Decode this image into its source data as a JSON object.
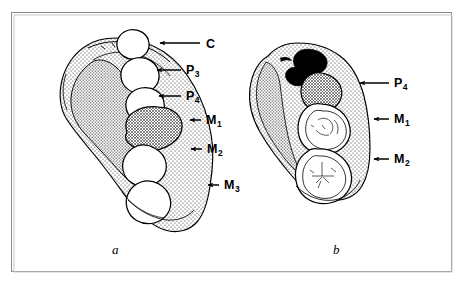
{
  "figure": {
    "type": "scientific-illustration",
    "background_color": "#ffffff",
    "ink_color": "#000000",
    "frame_color": "#8a8a8a",
    "panels": [
      {
        "id": "a",
        "caption": "a",
        "view": "lateral-buccal",
        "labels": [
          {
            "name": "canine",
            "text": "C",
            "sub": "",
            "x": 206,
            "y": 38,
            "arrow_from_x": 200,
            "arrow_to_x": 160,
            "arrow_y": 43
          },
          {
            "name": "premolar-3",
            "text": "P",
            "sub": "3",
            "x": 186,
            "y": 64,
            "arrow_from_x": 181,
            "arrow_to_x": 157,
            "arrow_y": 70
          },
          {
            "name": "premolar-4",
            "text": "P",
            "sub": "4",
            "x": 186,
            "y": 90,
            "arrow_from_x": 181,
            "arrow_to_x": 159,
            "arrow_y": 96
          },
          {
            "name": "molar-1",
            "text": "M",
            "sub": "1",
            "x": 206,
            "y": 114,
            "arrow_from_x": 201,
            "arrow_to_x": 190,
            "arrow_y": 120
          },
          {
            "name": "molar-2",
            "text": "M",
            "sub": "2",
            "x": 207,
            "y": 143,
            "arrow_from_x": 202,
            "arrow_to_x": 191,
            "arrow_y": 149
          },
          {
            "name": "molar-3",
            "text": "M",
            "sub": "3",
            "x": 224,
            "y": 179,
            "arrow_from_x": 219,
            "arrow_to_x": 208,
            "arrow_y": 185
          }
        ]
      },
      {
        "id": "b",
        "caption": "b",
        "view": "occlusal",
        "labels": [
          {
            "name": "premolar-4",
            "text": "P",
            "sub": "4",
            "x": 394,
            "y": 77,
            "arrow_from_x": 389,
            "arrow_to_x": 360,
            "arrow_y": 83
          },
          {
            "name": "molar-1",
            "text": "M",
            "sub": "1",
            "x": 394,
            "y": 113,
            "arrow_from_x": 389,
            "arrow_to_x": 374,
            "arrow_y": 119
          },
          {
            "name": "molar-2",
            "text": "M",
            "sub": "2",
            "x": 394,
            "y": 153,
            "arrow_from_x": 389,
            "arrow_to_x": 374,
            "arrow_y": 159
          }
        ]
      }
    ],
    "caption_a": {
      "text": "a",
      "x": 112,
      "y": 243
    },
    "caption_b": {
      "text": "b",
      "x": 333,
      "y": 243
    }
  }
}
